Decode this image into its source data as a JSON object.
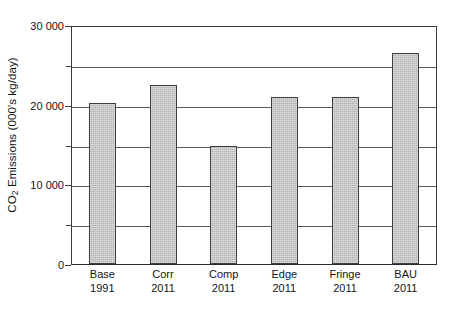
{
  "chart_data": {
    "type": "bar",
    "title": "",
    "subtitle": "",
    "xlabel": "",
    "ylabel_html": "CO2 Emissions (000's kg/day)",
    "ylabel_prefix": "CO",
    "ylabel_subscript": "2",
    "ylabel_suffix": " Emissions (000's kg/day)",
    "categories": [
      "Base",
      "Corr",
      "Comp",
      "Edge",
      "Fringe",
      "BAU"
    ],
    "category_years": [
      "1991",
      "2011",
      "2011",
      "2011",
      "2011",
      "2011"
    ],
    "values": [
      20400,
      22700,
      15000,
      21200,
      21200,
      26700
    ],
    "ylim": [
      0,
      30000
    ],
    "ytick_values": [
      0,
      5000,
      10000,
      15000,
      20000,
      25000,
      30000
    ],
    "ytick_labels": [
      "0",
      "",
      "10 000",
      "",
      "20 000",
      "",
      "30 000"
    ],
    "labeled_ticks": [
      "0",
      "10 000",
      "20 000",
      "30 000"
    ],
    "gridlines": [
      5000,
      10000,
      15000,
      20000,
      25000
    ],
    "grid": true,
    "legend": false,
    "legend_position": "none",
    "bar_color": "#c3c3c3",
    "bar_edge_color": "#3d3d3d",
    "axis_color": "#3a3a3a",
    "grid_color": "#5a5a5a",
    "background_color": "#ffffff"
  },
  "ticks": {
    "y0": "0",
    "y10000": "10 000",
    "y20000": "20 000",
    "y30000": "30 000"
  },
  "bars": [
    {
      "label": "Base",
      "year": "1991",
      "value": 20400
    },
    {
      "label": "Corr",
      "year": "2011",
      "value": 22700
    },
    {
      "label": "Comp",
      "year": "2011",
      "value": 15000
    },
    {
      "label": "Edge",
      "year": "2011",
      "value": 21200
    },
    {
      "label": "Fringe",
      "year": "2011",
      "value": 21200
    },
    {
      "label": "BAU",
      "year": "2011",
      "value": 26700
    }
  ]
}
